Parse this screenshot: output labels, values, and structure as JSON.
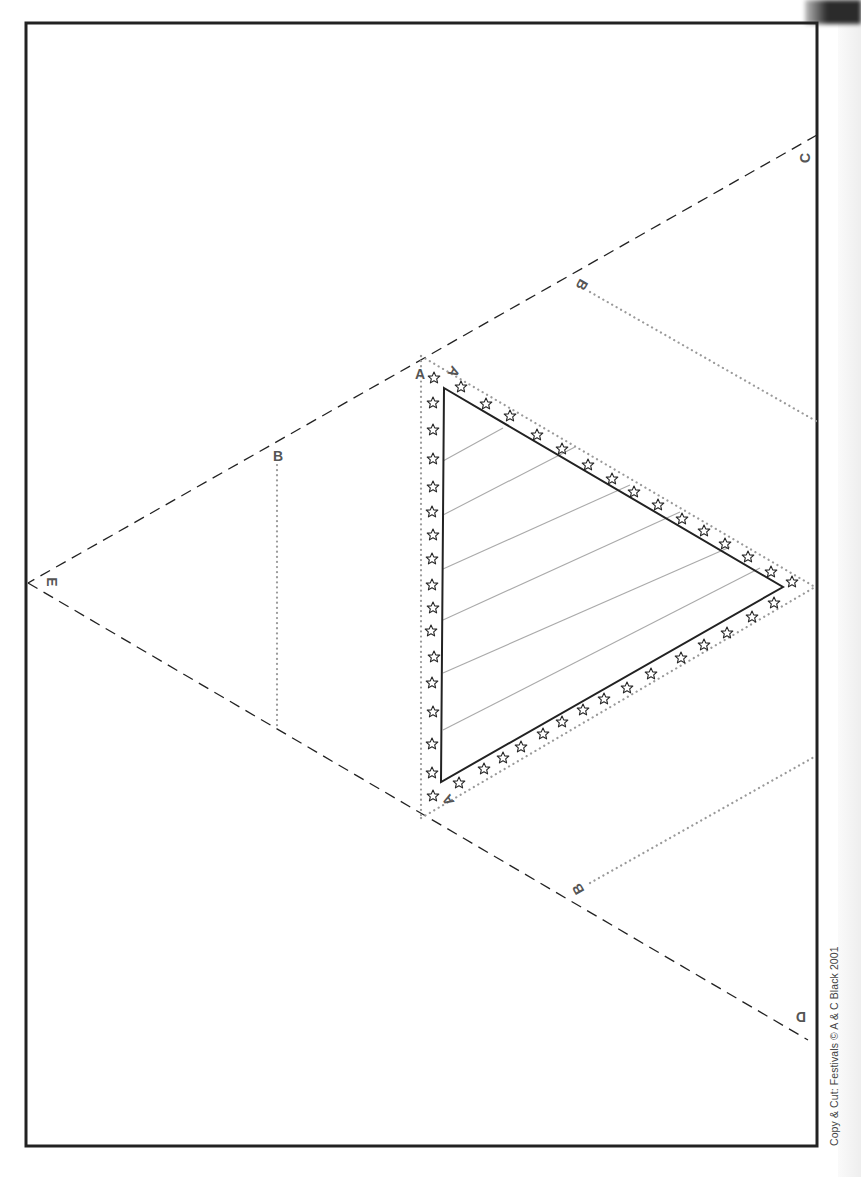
{
  "page": {
    "type": "printable-cut-out-template"
  },
  "labels": {
    "corner_c": "C",
    "corner_d": "D",
    "corner_e": "E",
    "fold_a_top_left": "A",
    "fold_a_top_right": "A",
    "fold_a_bottom": "A",
    "flap_b_top": "B",
    "flap_b_left": "B",
    "flap_b_bottom": "B"
  },
  "footer": {
    "copyright": "Copy & Cut: Festivals © A & C Black 2001"
  },
  "colors": {
    "border": "#222222",
    "dashed_cut_line": "#222222",
    "dotted_fold_line": "#9a9a9a",
    "stripe": "#aaaaaa",
    "star_outline": "#222222",
    "label": "#555555"
  },
  "decorations": {
    "star_icon": "outline-five-point-star",
    "stripe_count": 8
  }
}
